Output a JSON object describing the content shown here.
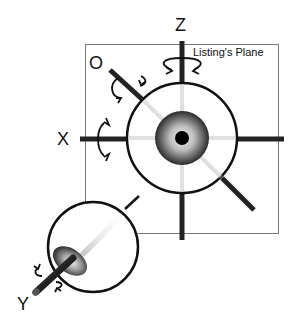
{
  "diagram": {
    "title": "Listing's Plane",
    "plane_label": "Listing's Plane",
    "axes": [
      {
        "id": "Z",
        "label": "Z"
      },
      {
        "id": "X",
        "label": "X"
      },
      {
        "id": "O",
        "label": "O"
      },
      {
        "id": "Y",
        "label": "Y"
      }
    ],
    "colors": {
      "stroke": "#111111",
      "plane_border": "#777777",
      "background": "#ffffff"
    }
  }
}
